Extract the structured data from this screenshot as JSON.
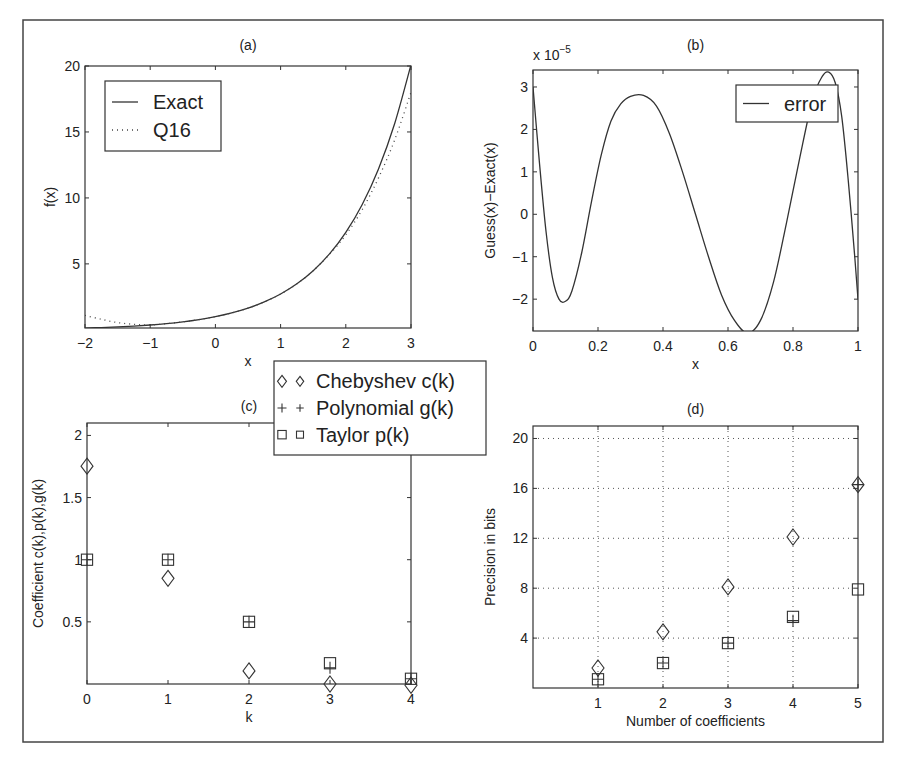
{
  "figure": {
    "frame": {
      "x": 23,
      "y": 20,
      "w": 860,
      "h": 722
    },
    "marker_colors": {
      "stroke": "#333333",
      "background": "#ffffff"
    }
  },
  "chart_data": [
    {
      "id": "a",
      "type": "line",
      "title": "(a)",
      "xlabel": "x",
      "ylabel": "f(x)",
      "xlim": [
        -2,
        3
      ],
      "ylim": [
        0.14,
        20
      ],
      "xticks": [
        -2,
        -1,
        0,
        1,
        2,
        3
      ],
      "xtick_labels": [
        "−2",
        "−1",
        "0",
        "1",
        "2",
        "3"
      ],
      "yticks": [
        5,
        10,
        15,
        20
      ],
      "ytick_labels": [
        "5",
        "10",
        "15",
        "20"
      ],
      "grid": false,
      "box": {
        "x0": 85,
        "y0": 66,
        "x1": 411,
        "y1": 328
      },
      "legend": {
        "position": "upper left",
        "box": {
          "x": 105,
          "y": 81,
          "w": 116,
          "h": 70
        },
        "entries": [
          {
            "label": "Exact",
            "style": "solid"
          },
          {
            "label": "Q16",
            "style": "dotted"
          }
        ]
      },
      "series": [
        {
          "name": "Exact",
          "style": "solid",
          "x": [
            -2,
            -1.75,
            -1.5,
            -1.25,
            -1,
            -0.75,
            -0.5,
            -0.25,
            0,
            0.25,
            0.5,
            0.75,
            1,
            1.25,
            1.5,
            1.75,
            2,
            2.25,
            2.5,
            2.75,
            3
          ],
          "y": [
            0.135,
            0.174,
            0.223,
            0.287,
            0.368,
            0.472,
            0.607,
            0.779,
            1.0,
            1.284,
            1.649,
            2.117,
            2.718,
            3.49,
            4.482,
            5.755,
            7.389,
            9.488,
            12.18,
            15.64,
            20.09
          ]
        },
        {
          "name": "Q16",
          "style": "dotted",
          "x": [
            -2,
            -1.75,
            -1.5,
            -1.25,
            -1,
            -0.75,
            -0.5,
            -0.25,
            0,
            0.25,
            0.5,
            0.75,
            1,
            1.25,
            1.5,
            1.75,
            2,
            2.25,
            2.5,
            2.75,
            3
          ],
          "y": [
            1.1,
            0.8,
            0.55,
            0.42,
            0.37,
            0.472,
            0.607,
            0.779,
            1.0,
            1.284,
            1.649,
            2.117,
            2.718,
            3.49,
            4.482,
            5.72,
            7.2,
            9.1,
            11.5,
            14.4,
            18.0
          ]
        }
      ]
    },
    {
      "id": "b",
      "type": "line",
      "title": "(b)",
      "xlabel": "x",
      "ylabel": "Guess(x)−Exact(x)",
      "y_multiplier": "x 10",
      "y_multiplier_exp": "−5",
      "xlim": [
        0,
        1
      ],
      "ylim": [
        -2.75,
        3.4
      ],
      "xticks": [
        0,
        0.2,
        0.4,
        0.6,
        0.8,
        1
      ],
      "xtick_labels": [
        "0",
        "0.2",
        "0.4",
        "0.6",
        "0.8",
        "1"
      ],
      "yticks": [
        -2,
        -1,
        0,
        1,
        2,
        3
      ],
      "ytick_labels": [
        "−2",
        "−1",
        "0",
        "1",
        "2",
        "3"
      ],
      "grid": false,
      "box": {
        "x0": 533,
        "y0": 70,
        "x1": 858,
        "y1": 331
      },
      "legend": {
        "position": "upper right",
        "box": {
          "x": 736,
          "y": 85,
          "w": 102,
          "h": 37
        },
        "entries": [
          {
            "label": "error",
            "style": "solid"
          }
        ]
      },
      "series": [
        {
          "name": "error",
          "style": "solid",
          "x": [
            0,
            0.02,
            0.04,
            0.06,
            0.08,
            0.1,
            0.12,
            0.15,
            0.18,
            0.21,
            0.24,
            0.27,
            0.3,
            0.34,
            0.38,
            0.42,
            0.46,
            0.5,
            0.54,
            0.58,
            0.62,
            0.66,
            0.7,
            0.74,
            0.78,
            0.82,
            0.86,
            0.89,
            0.91,
            0.93,
            0.95,
            0.97,
            0.99,
            1
          ],
          "y": [
            3.0,
            1.2,
            -0.4,
            -1.5,
            -2.0,
            -2.05,
            -1.8,
            -0.9,
            0.3,
            1.4,
            2.2,
            2.6,
            2.78,
            2.8,
            2.55,
            1.9,
            1.0,
            0.0,
            -1.0,
            -1.9,
            -2.5,
            -2.8,
            -2.5,
            -1.6,
            -0.2,
            1.3,
            2.7,
            3.25,
            3.35,
            3.1,
            2.3,
            0.8,
            -1.0,
            -2.0
          ]
        }
      ]
    },
    {
      "id": "c",
      "type": "scatter",
      "title": "(c)",
      "xlabel": "k",
      "ylabel": "Coefficient c(k),p(k),g(k)",
      "xlim": [
        0,
        4
      ],
      "ylim": [
        0,
        2.1
      ],
      "xticks": [
        0,
        1,
        2,
        3,
        4
      ],
      "xtick_labels": [
        "0",
        "1",
        "2",
        "3",
        "4"
      ],
      "yticks": [
        0.5,
        1,
        1.5,
        2
      ],
      "ytick_labels": [
        "0.5",
        "1",
        "1.5",
        "2"
      ],
      "grid": false,
      "box": {
        "x0": 87,
        "y0": 423,
        "x1": 411,
        "y1": 684
      },
      "legend": {
        "position": "upper right (outside)",
        "box": {
          "x": 274,
          "y": 361,
          "w": 212,
          "h": 94
        },
        "entries": [
          {
            "label": "Chebyshev c(k)",
            "marker": "diamond"
          },
          {
            "label": "Polynomial g(k)",
            "marker": "plus"
          },
          {
            "label": "Taylor p(k)",
            "marker": "square"
          }
        ]
      },
      "series": [
        {
          "name": "Chebyshev c(k)",
          "marker": "diamond",
          "x": [
            0,
            1,
            2,
            3,
            4
          ],
          "y": [
            1.753,
            0.85,
            0.105,
            0.0,
            -0.01
          ]
        },
        {
          "name": "Polynomial g(k)",
          "marker": "plus",
          "x": [
            0,
            1,
            2,
            3,
            4
          ],
          "y": [
            1.0,
            1.0,
            0.5,
            0.13,
            0.042
          ]
        },
        {
          "name": "Taylor p(k)",
          "marker": "square",
          "x": [
            0,
            1,
            2,
            3,
            4
          ],
          "y": [
            1.0,
            1.0,
            0.5,
            0.167,
            0.042
          ]
        }
      ]
    },
    {
      "id": "d",
      "type": "scatter",
      "title": "(d)",
      "xlabel": "Number of coefficients",
      "ylabel": "Precision in bits",
      "xlim": [
        0,
        5
      ],
      "ylim": [
        0,
        21
      ],
      "xticks": [
        1,
        2,
        3,
        4,
        5
      ],
      "xtick_labels": [
        "1",
        "2",
        "3",
        "4",
        "5"
      ],
      "yticks": [
        4,
        8,
        12,
        16,
        20
      ],
      "ytick_labels": [
        "4",
        "8",
        "12",
        "16",
        "20"
      ],
      "grid": true,
      "box": {
        "x0": 533,
        "y0": 426,
        "x1": 858,
        "y1": 688
      },
      "series": [
        {
          "name": "Chebyshev c(k)",
          "marker": "diamond",
          "x": [
            1,
            2,
            3,
            4,
            5
          ],
          "y": [
            1.6,
            4.5,
            8.1,
            12.1,
            16.3
          ]
        },
        {
          "name": "Polynomial g(k)",
          "marker": "plus",
          "x": [
            1,
            2,
            3,
            4,
            5
          ],
          "y": [
            0.7,
            2.0,
            3.6,
            5.4,
            16.3
          ]
        },
        {
          "name": "Taylor p(k)",
          "marker": "square",
          "x": [
            1,
            2,
            3,
            4,
            5
          ],
          "y": [
            0.7,
            2.0,
            3.6,
            5.7,
            7.9
          ]
        }
      ]
    }
  ]
}
